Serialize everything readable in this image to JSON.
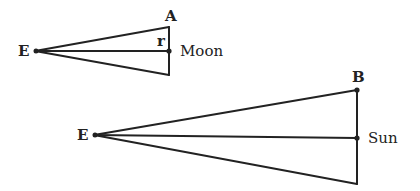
{
  "diagram": {
    "title": "",
    "figures": [
      {
        "id": "moon-triangle",
        "apex_label": "E",
        "top_label": "A",
        "center_label": "Moon",
        "angle_label": "r"
      },
      {
        "id": "sun-triangle",
        "apex_label": "E",
        "top_label": "B",
        "center_label": "Sun"
      }
    ],
    "colors": {
      "stroke": "#222222",
      "background": "#ffffff"
    }
  }
}
